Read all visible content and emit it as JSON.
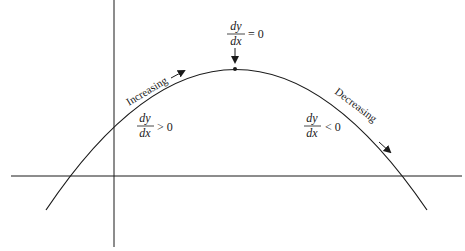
{
  "diagram": {
    "type": "function-graph",
    "colors": {
      "line": "#1a1a1a",
      "background": "#ffffff"
    },
    "axes": {
      "x_axis": {
        "from": [
          11,
          176
        ],
        "to": [
          462,
          176
        ]
      },
      "y_axis": {
        "from": [
          114,
          0
        ],
        "to": [
          114,
          247
        ]
      }
    },
    "curve": {
      "shape": "parabola (concave down)",
      "vertex": [
        235,
        69
      ],
      "start": [
        46,
        210
      ],
      "end": [
        427,
        210
      ]
    },
    "max_point": {
      "position": [
        235,
        69
      ],
      "label": {
        "numerator": "dy",
        "denominator": "dx",
        "relation": "= 0"
      }
    },
    "left_region": {
      "arrow_text": "Increasing",
      "label": {
        "numerator": "dy",
        "denominator": "dx",
        "relation": "> 0"
      }
    },
    "right_region": {
      "arrow_text": "Decreasing",
      "label": {
        "numerator": "dy",
        "denominator": "dx",
        "relation": "< 0"
      }
    }
  }
}
